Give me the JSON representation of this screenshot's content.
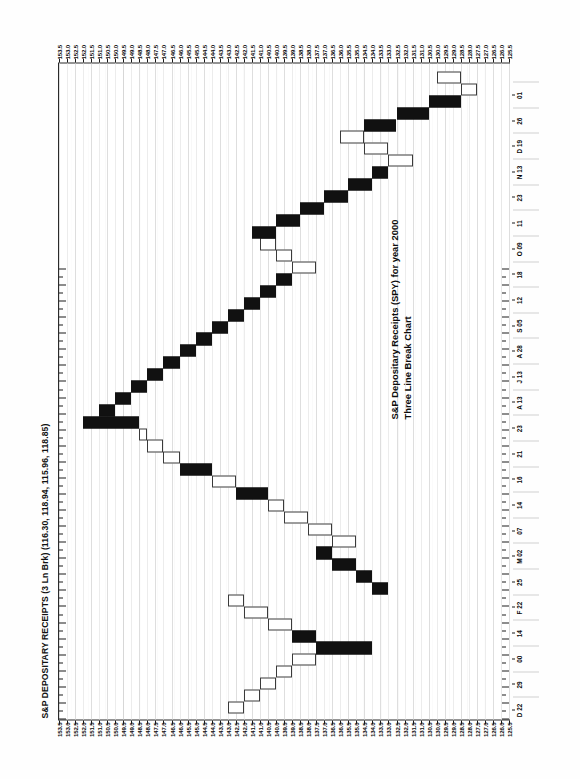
{
  "document": {
    "kind": "scanned-chart-page",
    "orientation": "landscape-rotated",
    "page_background": "#fefefe"
  },
  "chart_data": {
    "type": "bar",
    "chart_style": "three-line-break",
    "title": "S&P DEPOSITARY RECEIPTS (3 Ln Brk) (116.30, 118.94, 115.96, 118.85)",
    "subtitle_line1": "S&P Depositary Receipts (SPY) for year 2000",
    "subtitle_line2": "Three Line Break Chart",
    "xlabel": "",
    "ylabel": "",
    "grid": true,
    "legend": "none",
    "quote": {
      "open": 116.3,
      "high": 118.94,
      "low": 115.96,
      "close": 118.85
    },
    "ylim": [
      125.5,
      153.5
    ],
    "y_tick_step": 0.5,
    "y_ticks": [
      "153.5",
      "153.0",
      "152.5",
      "152.0",
      "151.5",
      "151.0",
      "150.5",
      "150.0",
      "149.5",
      "149.0",
      "148.5",
      "148.0",
      "147.5",
      "147.0",
      "146.5",
      "146.0",
      "145.5",
      "145.0",
      "144.5",
      "144.0",
      "143.5",
      "143.0",
      "142.5",
      "142.0",
      "141.5",
      "141.0",
      "140.5",
      "140.0",
      "139.5",
      "139.0",
      "138.5",
      "138.0",
      "137.5",
      "137.0",
      "136.5",
      "136.0",
      "135.5",
      "135.0",
      "134.5",
      "134.0",
      "133.5",
      "133.0",
      "132.5",
      "132.0",
      "131.5",
      "131.0",
      "130.5",
      "130.0",
      "129.5",
      "129.0",
      "128.5",
      "128.0",
      "127.5",
      "127.0",
      "126.5",
      "126.0",
      "125.5"
    ],
    "x_tick_labels": [
      "D 22",
      "29",
      "00",
      "14",
      "F 22",
      "25",
      "M 02",
      "07",
      "14",
      "16",
      "21",
      "23",
      "A 13",
      "J 13",
      "A 28",
      "S 05",
      "12",
      "18",
      "O 09",
      "11",
      "23",
      "N 13",
      "D 19",
      "26",
      "01"
    ],
    "categories": [
      "D 22",
      "29",
      "00",
      "14",
      "F 22",
      "25",
      "M 02",
      "07",
      "14",
      "16",
      "21",
      "23",
      "A 13",
      "J 13",
      "A 28",
      "S 05",
      "12",
      "18",
      "O 09",
      "11",
      "23",
      "N 13",
      "D 19",
      "26",
      "01"
    ],
    "series": [
      {
        "name": "Three Line Break blocks",
        "note": "Each block spans from its open price to its close price; direction up = filled black, down = hollow white.",
        "blocks": [
          {
            "i": 0,
            "dir": "down",
            "from": 143.0,
            "to": 142.0
          },
          {
            "i": 1,
            "dir": "down",
            "from": 142.0,
            "to": 141.0
          },
          {
            "i": 2,
            "dir": "down",
            "from": 141.0,
            "to": 140.0
          },
          {
            "i": 3,
            "dir": "down",
            "from": 140.0,
            "to": 139.0
          },
          {
            "i": 4,
            "dir": "down",
            "from": 139.0,
            "to": 137.5
          },
          {
            "i": 5,
            "dir": "up",
            "from": 137.5,
            "to": 134.0
          },
          {
            "i": 6,
            "dir": "up",
            "from": 139.0,
            "to": 137.5
          },
          {
            "i": 7,
            "dir": "down",
            "from": 140.5,
            "to": 139.0
          },
          {
            "i": 8,
            "dir": "down",
            "from": 142.0,
            "to": 140.5
          },
          {
            "i": 9,
            "dir": "down",
            "from": 143.0,
            "to": 142.0
          },
          {
            "i": 10,
            "dir": "up",
            "from": 134.0,
            "to": 133.0
          },
          {
            "i": 11,
            "dir": "up",
            "from": 135.0,
            "to": 134.0
          },
          {
            "i": 12,
            "dir": "up",
            "from": 136.5,
            "to": 135.0
          },
          {
            "i": 13,
            "dir": "up",
            "from": 137.5,
            "to": 136.5
          },
          {
            "i": 14,
            "dir": "down",
            "from": 136.5,
            "to": 135.0
          },
          {
            "i": 15,
            "dir": "down",
            "from": 138.0,
            "to": 136.5
          },
          {
            "i": 16,
            "dir": "down",
            "from": 139.5,
            "to": 138.0
          },
          {
            "i": 17,
            "dir": "down",
            "from": 140.5,
            "to": 139.5
          },
          {
            "i": 18,
            "dir": "up",
            "from": 142.5,
            "to": 140.5
          },
          {
            "i": 19,
            "dir": "down",
            "from": 144.0,
            "to": 142.5
          },
          {
            "i": 20,
            "dir": "up",
            "from": 146.0,
            "to": 144.0
          },
          {
            "i": 21,
            "dir": "down",
            "from": 147.0,
            "to": 146.0
          },
          {
            "i": 22,
            "dir": "down",
            "from": 148.0,
            "to": 147.0
          },
          {
            "i": 23,
            "dir": "down",
            "from": 148.5,
            "to": 148.0
          },
          {
            "i": 24,
            "dir": "up",
            "from": 152.0,
            "to": 148.5
          },
          {
            "i": 25,
            "dir": "up",
            "from": 151.0,
            "to": 150.0
          },
          {
            "i": 26,
            "dir": "up",
            "from": 150.0,
            "to": 149.0
          },
          {
            "i": 27,
            "dir": "up",
            "from": 149.0,
            "to": 148.0
          },
          {
            "i": 28,
            "dir": "up",
            "from": 148.0,
            "to": 147.0
          },
          {
            "i": 29,
            "dir": "up",
            "from": 147.0,
            "to": 146.0
          },
          {
            "i": 30,
            "dir": "up",
            "from": 146.0,
            "to": 145.0
          },
          {
            "i": 31,
            "dir": "up",
            "from": 145.0,
            "to": 144.0
          },
          {
            "i": 32,
            "dir": "up",
            "from": 144.0,
            "to": 143.0
          },
          {
            "i": 33,
            "dir": "up",
            "from": 143.0,
            "to": 142.0
          },
          {
            "i": 34,
            "dir": "up",
            "from": 142.0,
            "to": 141.0
          },
          {
            "i": 35,
            "dir": "up",
            "from": 141.0,
            "to": 140.0
          },
          {
            "i": 36,
            "dir": "up",
            "from": 140.0,
            "to": 139.0
          },
          {
            "i": 37,
            "dir": "down",
            "from": 139.0,
            "to": 137.5
          },
          {
            "i": 38,
            "dir": "down",
            "from": 140.0,
            "to": 139.0
          },
          {
            "i": 39,
            "dir": "down",
            "from": 141.0,
            "to": 140.0
          },
          {
            "i": 40,
            "dir": "up",
            "from": 141.5,
            "to": 140.0
          },
          {
            "i": 41,
            "dir": "up",
            "from": 140.0,
            "to": 138.5
          },
          {
            "i": 42,
            "dir": "up",
            "from": 138.5,
            "to": 137.0
          },
          {
            "i": 43,
            "dir": "up",
            "from": 137.0,
            "to": 135.5
          },
          {
            "i": 44,
            "dir": "up",
            "from": 135.5,
            "to": 134.0
          },
          {
            "i": 45,
            "dir": "up",
            "from": 134.0,
            "to": 133.0
          },
          {
            "i": 46,
            "dir": "down",
            "from": 133.0,
            "to": 131.5
          },
          {
            "i": 47,
            "dir": "down",
            "from": 134.5,
            "to": 133.0
          },
          {
            "i": 48,
            "dir": "down",
            "from": 136.0,
            "to": 134.5
          },
          {
            "i": 49,
            "dir": "up",
            "from": 134.5,
            "to": 132.5
          },
          {
            "i": 50,
            "dir": "up",
            "from": 132.5,
            "to": 130.5
          },
          {
            "i": 51,
            "dir": "up",
            "from": 130.5,
            "to": 128.5
          },
          {
            "i": 52,
            "dir": "down",
            "from": 128.5,
            "to": 127.5
          },
          {
            "i": 53,
            "dir": "down",
            "from": 130.0,
            "to": 128.5
          }
        ]
      }
    ]
  }
}
